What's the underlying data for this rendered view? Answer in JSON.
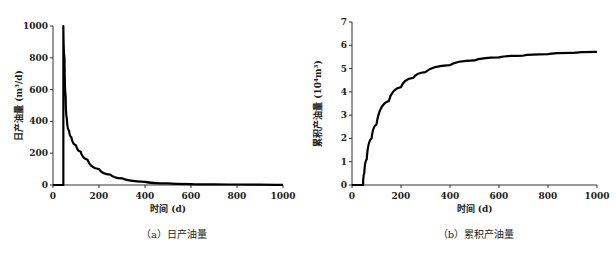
{
  "chart_data": [
    {
      "type": "line",
      "panel": "a",
      "caption": "（a）日产油量",
      "xlabel": "时间 (d)",
      "ylabel": "日产油量 (m³/d)",
      "xlim": [
        0,
        1000
      ],
      "ylim": [
        0,
        1000
      ],
      "xticks": [
        0,
        200,
        400,
        600,
        800,
        1000
      ],
      "yticks": [
        0,
        200,
        400,
        600,
        800,
        1000
      ],
      "grid": false,
      "series": [
        {
          "name": "日产油量",
          "color": "#000000",
          "x": [
            0,
            45,
            45,
            50,
            55,
            60,
            70,
            80,
            100,
            120,
            150,
            200,
            250,
            300,
            400,
            500,
            600,
            700,
            800,
            900,
            1000
          ],
          "y": [
            0,
            0,
            1000,
            800,
            560,
            420,
            340,
            300,
            250,
            210,
            160,
            100,
            65,
            42,
            20,
            10,
            6,
            4,
            3,
            2,
            1
          ]
        }
      ]
    },
    {
      "type": "line",
      "panel": "b",
      "caption": "（b）累积产油量",
      "xlabel": "时间 (d)",
      "ylabel": "累积产油量 (10⁴m³)",
      "xlim": [
        0,
        1000
      ],
      "ylim": [
        0,
        7
      ],
      "xticks": [
        0,
        200,
        400,
        600,
        800,
        1000
      ],
      "yticks": [
        0,
        1,
        2,
        3,
        4,
        5,
        6,
        7
      ],
      "grid": false,
      "series": [
        {
          "name": "累积产油量",
          "color": "#000000",
          "x": [
            0,
            45,
            50,
            60,
            80,
            100,
            150,
            200,
            250,
            300,
            400,
            500,
            600,
            700,
            800,
            900,
            1000
          ],
          "y": [
            0,
            0,
            0.5,
            1.1,
            2.0,
            2.6,
            3.6,
            4.2,
            4.6,
            4.85,
            5.15,
            5.35,
            5.48,
            5.56,
            5.62,
            5.67,
            5.72
          ]
        }
      ]
    }
  ]
}
